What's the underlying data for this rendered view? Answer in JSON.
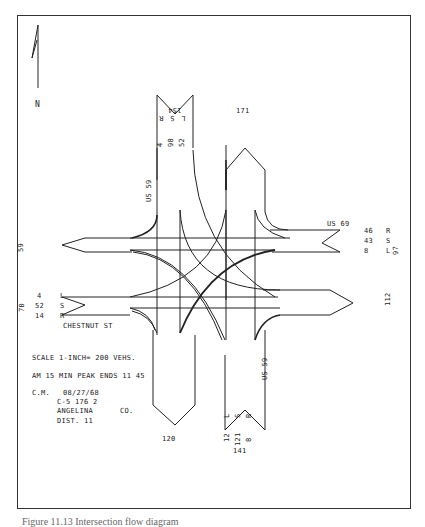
{
  "diagram": {
    "type": "traffic-flow-turning-movement-diagram",
    "north_arrow_label": "N",
    "roads": {
      "north_leg": "US 59",
      "south_leg": "US 59",
      "east_leg": "US 69",
      "west_leg": "CHESTNUT ST"
    },
    "north_approach": {
      "total": "154",
      "movements": [
        {
          "dir": "R",
          "volume": "4"
        },
        {
          "dir": "S",
          "volume": "98"
        },
        {
          "dir": "L",
          "volume": "52"
        }
      ],
      "exit_total": "171"
    },
    "east_approach": {
      "total": "97",
      "movements": [
        {
          "dir": "R",
          "volume": "46"
        },
        {
          "dir": "S",
          "volume": "43"
        },
        {
          "dir": "L",
          "volume": "8"
        }
      ],
      "exit_total": "112"
    },
    "west_approach": {
      "total": "70",
      "movements": [
        {
          "dir": "L",
          "volume": "4"
        },
        {
          "dir": "S",
          "volume": "52"
        },
        {
          "dir": "R",
          "volume": "14"
        }
      ],
      "exit_total": "59"
    },
    "south_approach": {
      "total": "141",
      "movements": [
        {
          "dir": "L",
          "volume": "12"
        },
        {
          "dir": "S",
          "volume": "121"
        },
        {
          "dir": "R",
          "volume": "8"
        }
      ],
      "exit_total": "120"
    },
    "notes": {
      "scale": "SCALE  1-INCH= 200   VEHS.",
      "peak": "AM 15 MIN PEAK ENDS  11 45",
      "observer": "C.M.",
      "date": "08/27/68",
      "station": "C-5   176    2",
      "county": "ANGELINA",
      "county_suffix": "CO.",
      "district": "DIST.  11"
    }
  },
  "caption": "Figure 11.13  Intersection flow diagram"
}
